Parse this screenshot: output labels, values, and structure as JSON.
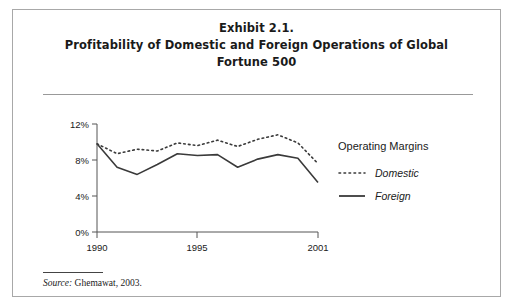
{
  "exhibit": {
    "title_lines": [
      "Exhibit 2.1.",
      "Profitability of Domestic and Foreign Operations of Global",
      "Fortune 500"
    ],
    "source_prefix": "Source:",
    "source_text": "Ghemawat, 2003."
  },
  "legend": {
    "title": "Operating Margins",
    "items": [
      {
        "label": "Domestic",
        "style": "dotted"
      },
      {
        "label": "Foreign",
        "style": "solid"
      }
    ]
  },
  "colors": {
    "line": "#3a3a3a",
    "axis": "#555555",
    "border": "#a8a8a8",
    "text": "#1a1a1a"
  },
  "chart_data": {
    "type": "line",
    "title": "Profitability of Domestic and Foreign Operations of Global Fortune 500",
    "xlabel": "",
    "ylabel": "Operating Margins",
    "x": [
      1990,
      1991,
      1992,
      1993,
      1994,
      1995,
      1996,
      1997,
      1998,
      1999,
      2000,
      2001
    ],
    "xlim": [
      1990,
      2001
    ],
    "ylim": [
      0,
      12
    ],
    "xticks": [
      1990,
      1995,
      2001
    ],
    "xtick_labels": [
      "1990",
      "1995",
      "2001"
    ],
    "yticks": [
      0,
      4,
      8,
      12
    ],
    "ytick_labels": [
      "0%",
      "4%",
      "8%",
      "12%"
    ],
    "grid": false,
    "legend_position": "right",
    "series": [
      {
        "name": "Domestic",
        "style": "dotted",
        "values": [
          9.8,
          8.7,
          9.2,
          9.0,
          9.9,
          9.6,
          10.2,
          9.5,
          10.3,
          10.8,
          9.9,
          7.6
        ]
      },
      {
        "name": "Foreign",
        "style": "solid",
        "values": [
          9.8,
          7.2,
          6.4,
          7.5,
          8.7,
          8.5,
          8.6,
          7.2,
          8.1,
          8.6,
          8.2,
          5.5
        ]
      }
    ]
  }
}
